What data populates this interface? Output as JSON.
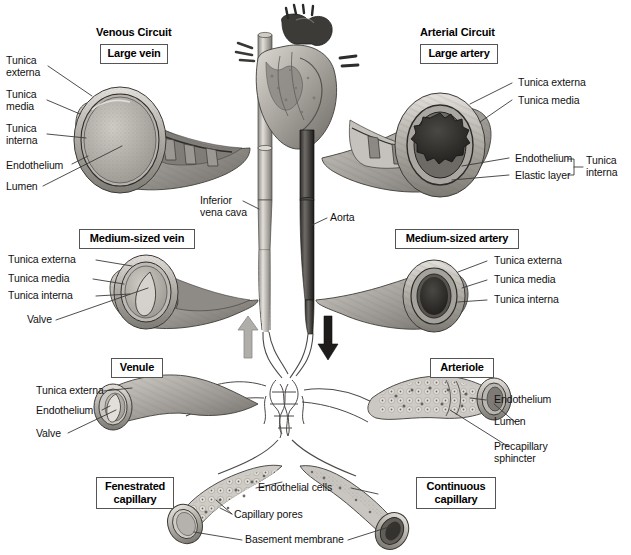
{
  "figure": {
    "type": "anatomical-diagram"
  },
  "headers": {
    "venous": "Venous Circuit",
    "arterial": "Arterial Circuit"
  },
  "vessel_boxes": {
    "large_vein": "Large vein",
    "large_artery": "Large artery",
    "medium_vein": "Medium-sized vein",
    "medium_artery": "Medium-sized artery",
    "venule": "Venule",
    "arteriole": "Arteriole",
    "fenestrated_capillary": "Fenestrated\ncapillary",
    "continuous_capillary": "Continuous\ncapillary"
  },
  "labels": {
    "large_vein": [
      {
        "text": "Tunica\nexterna"
      },
      {
        "text": "Tunica\nmedia"
      },
      {
        "text": "Tunica\ninterna"
      },
      {
        "text": "Endothelium"
      },
      {
        "text": "Lumen"
      }
    ],
    "large_artery": [
      {
        "text": "Tunica externa"
      },
      {
        "text": "Tunica media"
      },
      {
        "text": "Endothelium"
      },
      {
        "text": "Elastic layer"
      },
      {
        "text": "Tunica\ninterna"
      }
    ],
    "medium_vein": [
      {
        "text": "Tunica externa"
      },
      {
        "text": "Tunica media"
      },
      {
        "text": "Tunica interna"
      },
      {
        "text": "Valve"
      }
    ],
    "medium_artery": [
      {
        "text": "Tunica externa"
      },
      {
        "text": "Tunica media"
      },
      {
        "text": "Tunica interna"
      }
    ],
    "venule": [
      {
        "text": "Tunica externa"
      },
      {
        "text": "Endothelium"
      },
      {
        "text": "Valve"
      }
    ],
    "arteriole": [
      {
        "text": "Endothelium"
      },
      {
        "text": "Lumen"
      },
      {
        "text": "Precapillary\nsphincter"
      }
    ],
    "capillary": [
      {
        "text": "Endothelial cells"
      },
      {
        "text": "Capillary pores"
      },
      {
        "text": "Basement membrane"
      }
    ],
    "great_vessels": [
      {
        "text": "Inferior\nvena cava"
      },
      {
        "text": "Aorta"
      }
    ]
  },
  "flow_arrows": {
    "venous_return": {
      "direction": "up",
      "color": "#a8a8a8"
    },
    "arterial_outflow": {
      "direction": "down",
      "color": "#1a1a1a"
    }
  },
  "colors": {
    "ink": "#111111",
    "leader_line": "#444444",
    "box_border": "#555555",
    "tissue_light": "#d9d6d1",
    "tissue_mid": "#a9a5a0",
    "tissue_dark": "#6a6660",
    "lumen_dark": "#2b2b2b",
    "background": "#ffffff"
  }
}
